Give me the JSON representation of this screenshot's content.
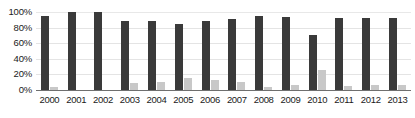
{
  "chart_data": {
    "type": "bar",
    "title": "",
    "subtitle": "",
    "xlabel": "",
    "ylabel": "",
    "ylim": [
      0,
      100
    ],
    "yticks": [
      "0%",
      "20%",
      "40%",
      "60%",
      "80%",
      "100%"
    ],
    "ytick_values": [
      0,
      20,
      40,
      60,
      80,
      100
    ],
    "grid": true,
    "legend_position": "none",
    "categories": [
      "2000",
      "2001",
      "2002",
      "2003",
      "2004",
      "2005",
      "2006",
      "2007",
      "2008",
      "2009",
      "2010",
      "2011",
      "2012",
      "2013"
    ],
    "series": [
      {
        "name": "primary",
        "color": "#3a3a3a",
        "values": [
          95,
          100,
          100,
          89,
          88,
          84,
          88,
          91,
          95,
          94,
          70,
          92,
          92,
          92
        ]
      },
      {
        "name": "secondary",
        "color": "#c8c8c8",
        "values": [
          4,
          0,
          0,
          9,
          10,
          16,
          13,
          10,
          4,
          6,
          26,
          5,
          7,
          6
        ]
      }
    ],
    "annotations": []
  },
  "colors": {
    "background": "#ffffff",
    "primary_bar": "#3a3a3a",
    "secondary_bar": "#c8c8c8",
    "gridline": "#e4e4e4",
    "axis_line": "#6f6f6f",
    "text": "#1a1a1a"
  }
}
